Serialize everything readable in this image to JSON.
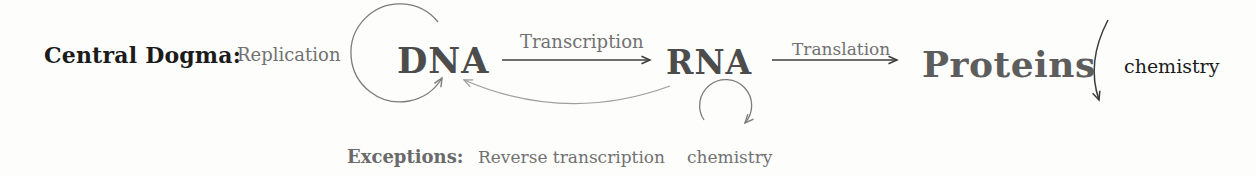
{
  "heading": {
    "label": "Central Dogma:"
  },
  "nodes": {
    "dna": {
      "label": "DNA"
    },
    "rna": {
      "label": "RNA"
    },
    "proteins": {
      "label": "Proteins"
    }
  },
  "processes": {
    "replication": {
      "label": "Replication"
    },
    "transcription": {
      "label": "Transcription"
    },
    "translation": {
      "label": "Translation"
    },
    "proteins_chemistry": {
      "label": "chemistry"
    }
  },
  "exceptions": {
    "heading": "Exceptions:",
    "items": {
      "reverse_transcription": {
        "label": "Reverse transcription"
      },
      "rna_chemistry": {
        "label": "chemistry"
      }
    }
  },
  "colors": {
    "ink_black": "#1b1b1b",
    "node_gray": "#4c4c4c",
    "proteins_gray": "#5d5d5d",
    "label_gray": "#717171",
    "arrow_dark": "#3c3c3c",
    "arrow_gray": "#7c7c7c",
    "arrow_light": "#9e9e9e",
    "background": "#fdfdfc"
  }
}
